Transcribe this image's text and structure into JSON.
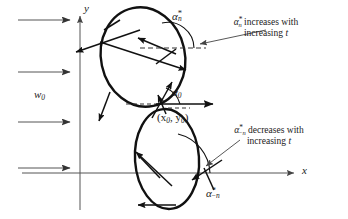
{
  "figure": {
    "kind": "vector-diagram",
    "background": "#ffffff",
    "stroke_color": "#1a1a1a",
    "axis_color": "#555555",
    "curve_color": "#111111",
    "width": 348,
    "height": 219
  },
  "axes": {
    "y_label": "y",
    "x_label": "x",
    "origin": {
      "x": 80,
      "y": 173
    },
    "y_axis": {
      "x": 80,
      "top": 16,
      "bottom": 210
    },
    "x_axis": {
      "y": 173,
      "left": 22,
      "right": 296
    }
  },
  "flow": {
    "label": "w",
    "label_sub": "0",
    "arrow_count": 4,
    "arrows": [
      {
        "y": 20,
        "x1": 18,
        "x2": 72
      },
      {
        "y": 72,
        "x1": 18,
        "x2": 72
      },
      {
        "y": 122,
        "x1": 18,
        "x2": 72
      },
      {
        "y": 168,
        "x1": 18,
        "x2": 72
      }
    ]
  },
  "curves": {
    "upper_loop": {
      "name": "upper-trajectory-loop",
      "cx": 143,
      "cy": 57,
      "rx": 42,
      "ry": 50,
      "rotation": -12
    },
    "lower_loop": {
      "name": "lower-trajectory-loop",
      "cx": 167,
      "cy": 159,
      "rx": 32,
      "ry": 50,
      "rotation": -4
    }
  },
  "markers": {
    "point_label": "(x",
    "point_label_sub1": "0",
    "point_label_mid": ", y",
    "point_label_sub2": "0",
    "point_label_end": ")",
    "point_x": 162,
    "point_y": 105,
    "alpha_zero": "α",
    "alpha_zero_sub": "0",
    "alpha_star_n": "α",
    "alpha_star_n_sub": "n",
    "alpha_star_n_sup": "*",
    "alpha_star_minus_n": "α",
    "alpha_star_minus_n_sub": "−n",
    "alpha_star_minus_n_sup": "*"
  },
  "annotations": {
    "upper": {
      "line1_alpha": "α",
      "line1_sub": "n",
      "line1_sup": "*",
      "line1_text": " increases with",
      "line2_text": "increasing ",
      "line2_italic": "t"
    },
    "lower": {
      "line1_alpha": "α",
      "line1_sub": "−n",
      "line1_sup": "*",
      "line1_text": " decreases with",
      "line2_text": "increasing ",
      "line2_italic": "t"
    }
  }
}
